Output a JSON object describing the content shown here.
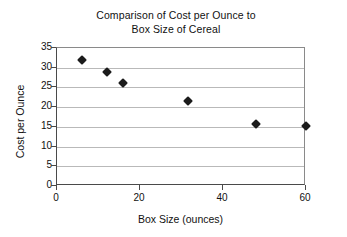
{
  "chart_data": {
    "type": "scatter",
    "title": "Comparison of Cost per Ounce to Box Size of Cereal",
    "title_lines": [
      "Comparison of Cost per Ounce to",
      "Box Size of Cereal"
    ],
    "xlabel": "Box Size (ounces)",
    "ylabel": "Cost per Ounce",
    "xlim": [
      0,
      60
    ],
    "ylim": [
      0,
      35
    ],
    "xticks": [
      0,
      20,
      40,
      60
    ],
    "xtick_labels": [
      "0",
      "20",
      "40",
      "60"
    ],
    "yticks": [
      0,
      5,
      10,
      15,
      20,
      25,
      30,
      35
    ],
    "ytick_labels": [
      "0",
      "5",
      "10",
      "15",
      "20",
      "25",
      "30",
      "35"
    ],
    "grid": "horizontal",
    "legend": "none",
    "marker": "diamond",
    "marker_color": "#1b1b1b",
    "points": [
      {
        "x": 6,
        "y": 32
      },
      {
        "x": 12,
        "y": 29
      },
      {
        "x": 16,
        "y": 26
      },
      {
        "x": 31.5,
        "y": 21.5
      },
      {
        "x": 48,
        "y": 15.8
      },
      {
        "x": 60,
        "y": 15.3
      }
    ],
    "series": [
      {
        "name": "Cost per Ounce",
        "x": [
          6,
          12,
          16,
          31.5,
          48,
          60
        ],
        "values": [
          32,
          29,
          26,
          21.5,
          15.8,
          15.3
        ]
      }
    ]
  },
  "colors": {
    "marker": "#1b1b1b",
    "gridline": "#b9b9b9",
    "axis": "#4a4a4a",
    "frame": "#8a8a8a",
    "background": "#ffffff",
    "text": "#111111"
  }
}
